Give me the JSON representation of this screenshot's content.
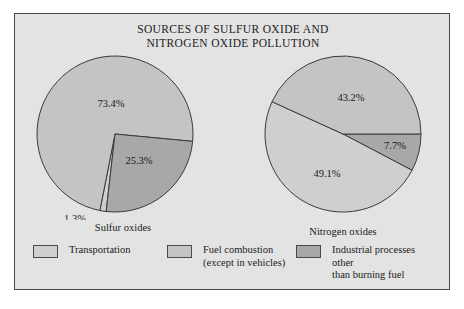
{
  "figure": {
    "title_lines": [
      "SOURCES OF SULFUR OXIDE AND",
      "NITROGEN OXIDE POLLUTION"
    ],
    "panel_background": "#e3e3e3",
    "border_color": "#4a4a4a"
  },
  "colors": {
    "transportation": "#cfcfcf",
    "fuel_combustion": "#c4c4c4",
    "industrial": "#a8a8a8",
    "outline": "#3a3a3a",
    "text": "#1b1b1b"
  },
  "legend": {
    "position": "bottom",
    "items": [
      {
        "label": "Transportation",
        "color": "#cfcfcf"
      },
      {
        "label": "Fuel combustion\n(except in vehicles)",
        "color": "#c4c4c4"
      },
      {
        "label": "Industrial processes other\nthan burning fuel",
        "color": "#a8a8a8"
      }
    ]
  },
  "chart_data": {
    "type": "pie",
    "title": "SOURCES OF SULFUR OXIDE AND NITROGEN OXIDE POLLUTION",
    "legend_position": "bottom",
    "charts": [
      {
        "name": "Sulfur oxides",
        "caption": "Sulfur oxides",
        "categories": [
          "Transportation",
          "Fuel combustion (except in vehicles)",
          "Industrial processes other than burning fuel"
        ],
        "values": [
          1.3,
          73.4,
          25.3
        ],
        "labels": [
          "1.3%",
          "73.4%",
          "25.3%"
        ],
        "colors": [
          "#cfcfcf",
          "#c4c4c4",
          "#a8a8a8"
        ],
        "slices": [
          {
            "label": "73.4%",
            "value": 73.4,
            "color": "#c4c4c4",
            "category": "Fuel combustion (except in vehicles)"
          },
          {
            "label": "25.3%",
            "value": 25.3,
            "color": "#a8a8a8",
            "category": "Industrial processes other than burning fuel"
          },
          {
            "label": "1.3%",
            "value": 1.3,
            "color": "#cfcfcf",
            "category": "Transportation"
          }
        ]
      },
      {
        "name": "Nitrogen oxides",
        "caption": "Nitrogen oxides",
        "categories": [
          "Transportation",
          "Fuel combustion (except in vehicles)",
          "Industrial processes other than burning fuel"
        ],
        "values": [
          49.1,
          43.2,
          7.7
        ],
        "labels": [
          "49.1%",
          "43.2%",
          "7.7%"
        ],
        "colors": [
          "#cfcfcf",
          "#c4c4c4",
          "#a8a8a8"
        ],
        "slices": [
          {
            "label": "7.7%",
            "value": 7.7,
            "color": "#a8a8a8",
            "category": "Industrial processes other than burning fuel"
          },
          {
            "label": "49.1%",
            "value": 49.1,
            "color": "#cfcfcf",
            "category": "Transportation"
          },
          {
            "label": "43.2%",
            "value": 43.2,
            "color": "#c4c4c4",
            "category": "Fuel combustion (except in vehicles)"
          }
        ]
      }
    ]
  }
}
